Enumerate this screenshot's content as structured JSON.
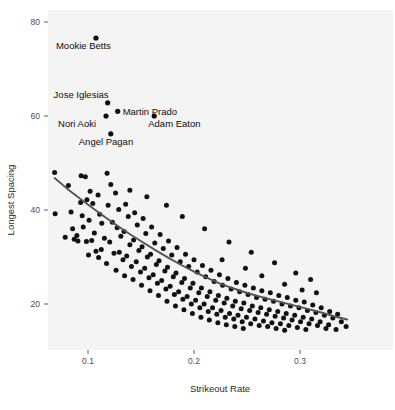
{
  "chart_data": {
    "type": "scatter",
    "title": "",
    "subtitle": "",
    "xlabel": "Strikeout Rate",
    "ylabel": "Longest Spacing",
    "xlim": [
      0.055,
      0.355
    ],
    "ylim": [
      11.0,
      82.0
    ],
    "grid": false,
    "legend": "none",
    "xticks": [
      0.1,
      0.2,
      0.3
    ],
    "xtick_labels": [
      "0.1",
      "0.2",
      "0.3"
    ],
    "yticks": [
      20,
      40,
      60,
      80
    ],
    "ytick_labels": [
      "20",
      "40",
      "60",
      "80"
    ],
    "point_color": "#111111",
    "panel_color": "#f4f4f4",
    "trend": {
      "name": "loess smooth",
      "type": "line",
      "color": "#555555",
      "x": [
        0.0685,
        0.08,
        0.092,
        0.104,
        0.116,
        0.128,
        0.14,
        0.152,
        0.164,
        0.176,
        0.188,
        0.2,
        0.212,
        0.224,
        0.236,
        0.248,
        0.26,
        0.272,
        0.284,
        0.296,
        0.308,
        0.32,
        0.332,
        0.3445
      ],
      "y": [
        46.8,
        44.6,
        42.5,
        40.5,
        38.5,
        36.6,
        34.8,
        33.1,
        31.4,
        29.8,
        28.3,
        26.9,
        25.6,
        24.4,
        23.4,
        22.5,
        21.7,
        21.0,
        20.3,
        19.6,
        18.9,
        18.2,
        17.4,
        16.7
      ]
    },
    "annotations": [
      {
        "label": "Mookie Betts",
        "x": 0.1075,
        "y": 76.6,
        "label_dx": -40,
        "label_dy": 11
      },
      {
        "label": "Jose Iglesias",
        "x": 0.1185,
        "y": 62.8,
        "label_dx": -54,
        "label_dy": -5
      },
      {
        "label": "Martin Prado",
        "x": 0.128,
        "y": 61.0,
        "label_dx": 5,
        "label_dy": 4
      },
      {
        "label": "Nori Aoki",
        "x": 0.117,
        "y": 60.0,
        "label_dx": -48,
        "label_dy": 11
      },
      {
        "label": "Adam Eaton",
        "x": 0.1625,
        "y": 60.0,
        "label_dx": -6,
        "label_dy": 11
      },
      {
        "label": "Angel Pagan",
        "x": 0.1215,
        "y": 56.2,
        "label_dx": -32,
        "label_dy": 11
      }
    ],
    "points": [
      [
        0.0685,
        48.0
      ],
      [
        0.0815,
        45.2
      ],
      [
        0.084,
        39.6
      ],
      [
        0.069,
        39.2
      ],
      [
        0.0855,
        36.0
      ],
      [
        0.0895,
        34.6
      ],
      [
        0.0785,
        34.2
      ],
      [
        0.087,
        33.8
      ],
      [
        0.0935,
        47.3
      ],
      [
        0.0975,
        47.1
      ],
      [
        0.099,
        42.2
      ],
      [
        0.093,
        41.6
      ],
      [
        0.0945,
        38.8
      ],
      [
        0.0955,
        36.4
      ],
      [
        0.0905,
        33.4
      ],
      [
        0.0985,
        33.3
      ],
      [
        0.102,
        44.0
      ],
      [
        0.1045,
        41.4
      ],
      [
        0.101,
        37.8
      ],
      [
        0.106,
        35.1
      ],
      [
        0.1035,
        33.5
      ],
      [
        0.1075,
        31.2
      ],
      [
        0.1005,
        30.4
      ],
      [
        0.1095,
        43.2
      ],
      [
        0.111,
        39.1
      ],
      [
        0.113,
        37.2
      ],
      [
        0.1155,
        34.0
      ],
      [
        0.1125,
        31.6
      ],
      [
        0.11,
        29.9
      ],
      [
        0.118,
        47.8
      ],
      [
        0.1215,
        45.4
      ],
      [
        0.119,
        41.0
      ],
      [
        0.123,
        37.4
      ],
      [
        0.1205,
        33.2
      ],
      [
        0.1245,
        30.8
      ],
      [
        0.1175,
        28.6
      ],
      [
        0.126,
        43.6
      ],
      [
        0.129,
        40.1
      ],
      [
        0.1275,
        36.2
      ],
      [
        0.131,
        34.4
      ],
      [
        0.1295,
        31.0
      ],
      [
        0.133,
        29.4
      ],
      [
        0.1265,
        27.2
      ],
      [
        0.1355,
        41.2
      ],
      [
        0.138,
        38.6
      ],
      [
        0.134,
        35.4
      ],
      [
        0.1395,
        32.6
      ],
      [
        0.1365,
        30.2
      ],
      [
        0.141,
        28.0
      ],
      [
        0.1345,
        26.0
      ],
      [
        0.144,
        39.4
      ],
      [
        0.1465,
        36.8
      ],
      [
        0.143,
        33.6
      ],
      [
        0.148,
        31.4
      ],
      [
        0.1455,
        29.0
      ],
      [
        0.1495,
        26.8
      ],
      [
        0.1425,
        25.2
      ],
      [
        0.152,
        38.2
      ],
      [
        0.1545,
        35.0
      ],
      [
        0.151,
        32.2
      ],
      [
        0.156,
        30.0
      ],
      [
        0.1535,
        27.6
      ],
      [
        0.1575,
        25.6
      ],
      [
        0.1505,
        24.0
      ],
      [
        0.16,
        36.4
      ],
      [
        0.163,
        33.0
      ],
      [
        0.159,
        30.6
      ],
      [
        0.1645,
        28.4
      ],
      [
        0.1615,
        26.2
      ],
      [
        0.1655,
        24.4
      ],
      [
        0.1585,
        22.8
      ],
      [
        0.168,
        34.8
      ],
      [
        0.171,
        31.8
      ],
      [
        0.167,
        29.2
      ],
      [
        0.1725,
        27.0
      ],
      [
        0.1695,
        25.0
      ],
      [
        0.1735,
        23.2
      ],
      [
        0.1665,
        21.8
      ],
      [
        0.176,
        33.4
      ],
      [
        0.179,
        30.4
      ],
      [
        0.175,
        27.8
      ],
      [
        0.1805,
        25.8
      ],
      [
        0.1775,
        23.8
      ],
      [
        0.1815,
        22.0
      ],
      [
        0.1745,
        20.6
      ],
      [
        0.184,
        32.0
      ],
      [
        0.187,
        29.0
      ],
      [
        0.183,
        26.6
      ],
      [
        0.1885,
        24.6
      ],
      [
        0.1855,
        22.6
      ],
      [
        0.1895,
        21.0
      ],
      [
        0.1825,
        19.6
      ],
      [
        0.192,
        30.6
      ],
      [
        0.195,
        28.0
      ],
      [
        0.191,
        25.4
      ],
      [
        0.1965,
        23.4
      ],
      [
        0.1935,
        21.6
      ],
      [
        0.1975,
        20.0
      ],
      [
        0.1905,
        18.8
      ],
      [
        0.2,
        29.4
      ],
      [
        0.203,
        26.8
      ],
      [
        0.199,
        24.4
      ],
      [
        0.2045,
        22.4
      ],
      [
        0.2015,
        20.8
      ],
      [
        0.2055,
        19.2
      ],
      [
        0.1985,
        18.0
      ],
      [
        0.208,
        28.2
      ],
      [
        0.211,
        25.8
      ],
      [
        0.207,
        23.4
      ],
      [
        0.2125,
        21.6
      ],
      [
        0.2095,
        20.0
      ],
      [
        0.2135,
        18.4
      ],
      [
        0.2065,
        17.2
      ],
      [
        0.216,
        27.2
      ],
      [
        0.219,
        24.8
      ],
      [
        0.215,
        22.6
      ],
      [
        0.2205,
        20.8
      ],
      [
        0.2175,
        19.2
      ],
      [
        0.2215,
        17.8
      ],
      [
        0.2145,
        16.6
      ],
      [
        0.224,
        26.2
      ],
      [
        0.227,
        24.0
      ],
      [
        0.223,
        21.8
      ],
      [
        0.2285,
        20.2
      ],
      [
        0.2255,
        18.6
      ],
      [
        0.2295,
        17.2
      ],
      [
        0.2225,
        16.0
      ],
      [
        0.232,
        25.4
      ],
      [
        0.235,
        23.2
      ],
      [
        0.231,
        21.2
      ],
      [
        0.2365,
        19.6
      ],
      [
        0.2335,
        18.0
      ],
      [
        0.2375,
        16.8
      ],
      [
        0.2305,
        15.6
      ],
      [
        0.24,
        24.6
      ],
      [
        0.243,
        22.6
      ],
      [
        0.239,
        20.6
      ],
      [
        0.2445,
        19.0
      ],
      [
        0.2415,
        17.6
      ],
      [
        0.2455,
        16.2
      ],
      [
        0.2385,
        15.2
      ],
      [
        0.248,
        24.0
      ],
      [
        0.251,
        22.0
      ],
      [
        0.247,
        20.2
      ],
      [
        0.2525,
        18.6
      ],
      [
        0.2495,
        17.2
      ],
      [
        0.2535,
        15.8
      ],
      [
        0.2465,
        14.8
      ],
      [
        0.256,
        23.4
      ],
      [
        0.259,
        21.4
      ],
      [
        0.255,
        19.6
      ],
      [
        0.2605,
        18.2
      ],
      [
        0.2575,
        16.8
      ],
      [
        0.2615,
        15.4
      ],
      [
        0.264,
        22.8
      ],
      [
        0.267,
        21.0
      ],
      [
        0.263,
        19.2
      ],
      [
        0.2685,
        17.8
      ],
      [
        0.2655,
        16.4
      ],
      [
        0.2695,
        15.2
      ],
      [
        0.272,
        22.4
      ],
      [
        0.275,
        20.6
      ],
      [
        0.271,
        18.8
      ],
      [
        0.2765,
        17.4
      ],
      [
        0.2735,
        16.0
      ],
      [
        0.2775,
        14.8
      ],
      [
        0.28,
        21.8
      ],
      [
        0.283,
        20.0
      ],
      [
        0.279,
        18.4
      ],
      [
        0.2845,
        17.0
      ],
      [
        0.2815,
        15.8
      ],
      [
        0.2855,
        14.4
      ],
      [
        0.288,
        21.4
      ],
      [
        0.291,
        19.6
      ],
      [
        0.287,
        18.0
      ],
      [
        0.2925,
        16.6
      ],
      [
        0.2895,
        15.4
      ],
      [
        0.296,
        20.8
      ],
      [
        0.299,
        19.2
      ],
      [
        0.295,
        17.6
      ],
      [
        0.3005,
        16.2
      ],
      [
        0.2975,
        15.0
      ],
      [
        0.304,
        20.4
      ],
      [
        0.307,
        18.6
      ],
      [
        0.303,
        17.2
      ],
      [
        0.3085,
        15.8
      ],
      [
        0.3055,
        14.6
      ],
      [
        0.312,
        19.8
      ],
      [
        0.315,
        18.2
      ],
      [
        0.311,
        16.8
      ],
      [
        0.3165,
        15.4
      ],
      [
        0.32,
        19.2
      ],
      [
        0.323,
        17.6
      ],
      [
        0.319,
        16.2
      ],
      [
        0.3245,
        14.8
      ],
      [
        0.328,
        18.4
      ],
      [
        0.331,
        17.0
      ],
      [
        0.327,
        15.6
      ],
      [
        0.3355,
        17.8
      ],
      [
        0.339,
        16.2
      ],
      [
        0.334,
        14.6
      ],
      [
        0.3435,
        15.2
      ],
      [
        0.2265,
        29.4
      ],
      [
        0.2485,
        27.6
      ],
      [
        0.264,
        26.0
      ],
      [
        0.2855,
        24.2
      ],
      [
        0.302,
        23.0
      ],
      [
        0.3155,
        22.4
      ],
      [
        0.1395,
        44.2
      ],
      [
        0.1555,
        42.8
      ],
      [
        0.174,
        41.0
      ],
      [
        0.189,
        38.6
      ],
      [
        0.21,
        36.0
      ],
      [
        0.233,
        33.2
      ],
      [
        0.254,
        31.0
      ],
      [
        0.276,
        28.8
      ],
      [
        0.31,
        25.2
      ],
      [
        0.296,
        26.6
      ]
    ]
  }
}
